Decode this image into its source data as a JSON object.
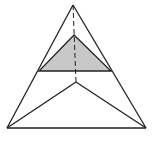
{
  "diagram": {
    "type": "geometry",
    "colors": {
      "background": "#ffffff",
      "stroke": "#222222",
      "fill": "#c8c8c8"
    },
    "points": {
      "apex": [
        73,
        5
      ],
      "bottom_left": [
        7,
        128
      ],
      "bottom_right": [
        146,
        128
      ],
      "inner_base": [
        76,
        82
      ],
      "section_top": [
        74,
        35
      ],
      "section_left": [
        39,
        71
      ],
      "section_right": [
        111,
        71
      ]
    }
  }
}
